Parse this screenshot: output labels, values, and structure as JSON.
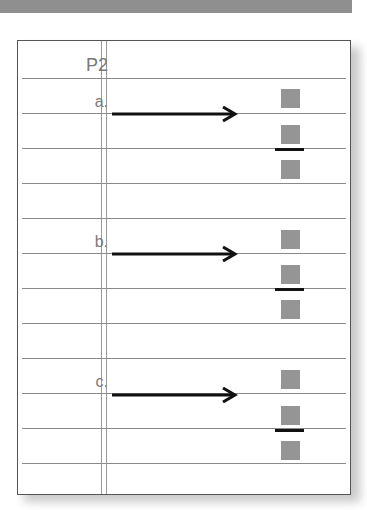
{
  "header": {
    "label": "P2"
  },
  "problems": [
    {
      "label": "a."
    },
    {
      "label": "b."
    },
    {
      "label": "c."
    }
  ],
  "colors": {
    "square": "#959595",
    "arrow": "#111111",
    "rule": "#8a8a8a"
  }
}
